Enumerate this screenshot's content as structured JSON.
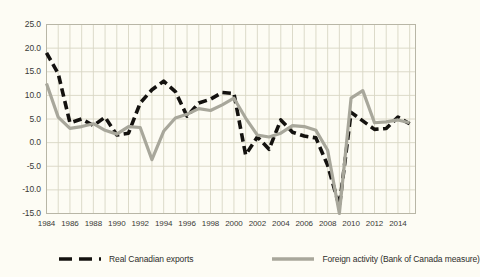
{
  "chart_data": {
    "type": "line",
    "title": "",
    "subtitle": "",
    "xlabel": "",
    "ylabel": "",
    "xlim": [
      1984,
      2015.5
    ],
    "ylim": [
      -15.0,
      25.0
    ],
    "grid": true,
    "legend_position": "bottom",
    "y_ticks": [
      "25.0",
      "20.0",
      "15.0",
      "10.0",
      "5.0",
      "0.0",
      "-5.0",
      "-10.0",
      "-15.0"
    ],
    "y_tick_values": [
      25.0,
      20.0,
      15.0,
      10.0,
      5.0,
      0.0,
      -5.0,
      -10.0,
      -15.0
    ],
    "x_ticks": [
      "1984",
      "1986",
      "1988",
      "1990",
      "1992",
      "1994",
      "1996",
      "1998",
      "2000",
      "2002",
      "2004",
      "2006",
      "2008",
      "2010",
      "2012",
      "2014"
    ],
    "x_tick_values": [
      1984,
      1986,
      1988,
      1990,
      1992,
      1994,
      1996,
      1998,
      2000,
      2002,
      2004,
      2006,
      2008,
      2010,
      2012,
      2014
    ],
    "x": [
      1984,
      1985,
      1986,
      1987,
      1988,
      1989,
      1990,
      1991,
      1992,
      1993,
      1994,
      1995,
      1996,
      1997,
      1998,
      1999,
      2000,
      2001,
      2002,
      2003,
      2004,
      2005,
      2006,
      2007,
      2008,
      2009,
      2010,
      2011,
      2012,
      2013,
      2014,
      2015
    ],
    "series": [
      {
        "name": "Real Canadian exports",
        "color": "#14120f",
        "style": "dashed",
        "values": [
          19.0,
          14.6,
          4.2,
          5.0,
          3.6,
          5.4,
          1.6,
          2.0,
          8.4,
          11.2,
          13.0,
          10.8,
          5.6,
          8.4,
          9.2,
          10.6,
          10.4,
          -2.6,
          1.2,
          -1.4,
          4.8,
          2.2,
          1.4,
          1.0,
          -4.8,
          -13.5,
          6.4,
          4.6,
          2.8,
          3.0,
          5.4,
          4.0
        ]
      },
      {
        "name": "Foreign activity (Bank of Canada measure)",
        "color": "#a8a79b",
        "style": "solid",
        "values": [
          12.5,
          5.4,
          3.0,
          3.4,
          4.0,
          2.6,
          1.8,
          3.4,
          3.2,
          -3.6,
          2.4,
          5.2,
          6.0,
          7.2,
          6.8,
          8.0,
          9.4,
          5.2,
          1.6,
          1.2,
          2.0,
          3.6,
          3.4,
          2.6,
          -1.6,
          -15.0,
          9.4,
          11.0,
          4.2,
          4.4,
          4.8,
          4.2
        ]
      }
    ]
  },
  "legend": {
    "entries": [
      {
        "label": "Real Canadian exports"
      },
      {
        "label": "Foreign activity (Bank of Canada measure)"
      }
    ]
  },
  "colors": {
    "background": "#fdfcf4",
    "grid": "#d8d6c4",
    "axis": "#b8b6a6",
    "exports_line": "#14120f",
    "foreign_line": "#a8a79b",
    "text": "#3a3a36"
  }
}
